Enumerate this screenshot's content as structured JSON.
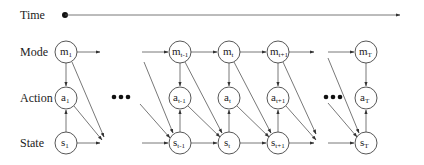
{
  "rows": {
    "time": "Time",
    "mode": "Mode",
    "action": "Action",
    "state": "State"
  },
  "columns": [
    {
      "id": "1",
      "mode": {
        "base": "m",
        "sub": "1"
      },
      "action": {
        "base": "a",
        "sub": "1"
      },
      "state": {
        "base": "s",
        "sub": "1"
      }
    },
    {
      "id": "t-1",
      "mode": {
        "base": "m",
        "sub": "t-1"
      },
      "action": {
        "base": "a",
        "sub": "t-1"
      },
      "state": {
        "base": "s",
        "sub": "t-1"
      }
    },
    {
      "id": "t",
      "mode": {
        "base": "m",
        "sub": "t"
      },
      "action": {
        "base": "a",
        "sub": "t"
      },
      "state": {
        "base": "s",
        "sub": "t"
      }
    },
    {
      "id": "t+1",
      "mode": {
        "base": "m",
        "sub": "t+1"
      },
      "action": {
        "base": "a",
        "sub": "t+1"
      },
      "state": {
        "base": "s",
        "sub": "t+1"
      }
    },
    {
      "id": "T",
      "mode": {
        "base": "m",
        "sub": "T"
      },
      "action": {
        "base": "a",
        "sub": "T"
      },
      "state": {
        "base": "s",
        "sub": "T"
      }
    }
  ],
  "ellipsis": [
    "•••",
    "•••"
  ],
  "colors": {
    "stroke": "#444444",
    "text": "#222222",
    "background": "#ffffff"
  }
}
